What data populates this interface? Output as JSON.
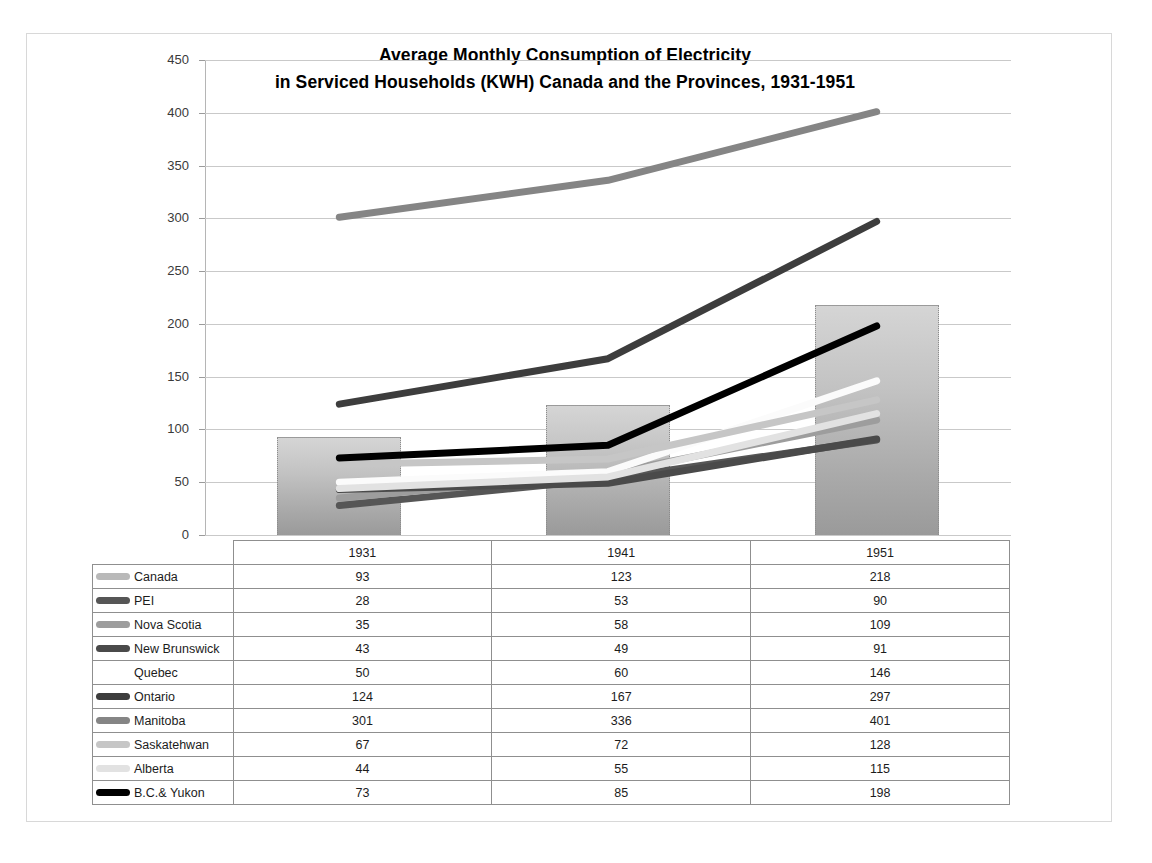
{
  "chart_data": {
    "type": "line",
    "title_line1": "Average Monthly Consumption  of Electricity",
    "title_line2": "in Serviced Households  (KWH) Canada  and the Provinces, 1931-1951",
    "xlabel": "",
    "ylabel": "",
    "ylim": [
      0,
      450
    ],
    "ytick_step": 50,
    "yticks": [
      "450",
      "400",
      "350",
      "300",
      "250",
      "200",
      "150",
      "100",
      "50",
      "0"
    ],
    "grid": true,
    "legend_position": "table-below",
    "categories": [
      "1931",
      "1941",
      "1951"
    ],
    "series": [
      {
        "name": "Canada",
        "values": [
          93,
          123,
          218
        ],
        "color": "#b9b9b9",
        "render": "column"
      },
      {
        "name": "PEI",
        "values": [
          28,
          53,
          90
        ],
        "color": "#565656",
        "render": "line"
      },
      {
        "name": "Nova Scotia",
        "values": [
          35,
          58,
          109
        ],
        "color": "#9d9d9d",
        "render": "line"
      },
      {
        "name": "New Brunswick",
        "values": [
          43,
          49,
          91
        ],
        "color": "#4a4a4a",
        "render": "line"
      },
      {
        "name": "Quebec",
        "values": [
          50,
          60,
          146
        ],
        "color": "#fbfbfb",
        "render": "line"
      },
      {
        "name": "Ontario",
        "values": [
          124,
          167,
          297
        ],
        "color": "#3d3d3d",
        "render": "line"
      },
      {
        "name": "Manitoba",
        "values": [
          301,
          336,
          401
        ],
        "color": "#858585",
        "render": "line"
      },
      {
        "name": "Saskatehwan",
        "values": [
          67,
          72,
          128
        ],
        "color": "#c6c6c6",
        "render": "line"
      },
      {
        "name": "Alberta",
        "values": [
          44,
          55,
          115
        ],
        "color": "#e2e2e2",
        "render": "line"
      },
      {
        "name": "B.C.& Yukon",
        "values": [
          73,
          85,
          198
        ],
        "color": "#000000",
        "render": "line"
      }
    ]
  },
  "table": {
    "header": [
      "",
      "1931",
      "1941",
      "1951"
    ],
    "rows": [
      {
        "label": "Canada",
        "v1931": "93",
        "v1941": "123",
        "v1951": "218"
      },
      {
        "label": "PEI",
        "v1931": "28",
        "v1941": "53",
        "v1951": "90"
      },
      {
        "label": "Nova Scotia",
        "v1931": "35",
        "v1941": "58",
        "v1951": "109"
      },
      {
        "label": "New Brunswick",
        "v1931": "43",
        "v1941": "49",
        "v1951": "91"
      },
      {
        "label": "Quebec",
        "v1931": "50",
        "v1941": "60",
        "v1951": "146"
      },
      {
        "label": "Ontario",
        "v1931": "124",
        "v1941": "167",
        "v1951": "297"
      },
      {
        "label": "Manitoba",
        "v1931": "301",
        "v1941": "336",
        "v1951": "401"
      },
      {
        "label": "Saskatehwan",
        "v1931": "67",
        "v1941": "72",
        "v1951": "128"
      },
      {
        "label": "Alberta",
        "v1931": "44",
        "v1941": "55",
        "v1951": "115"
      },
      {
        "label": "B.C.& Yukon",
        "v1931": "73",
        "v1941": "85",
        "v1951": "198"
      }
    ]
  }
}
